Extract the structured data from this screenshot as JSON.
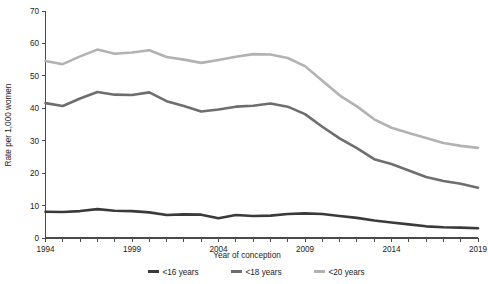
{
  "chart_data": {
    "type": "line",
    "title": "",
    "xlabel": "Year of conception",
    "ylabel": "Rate per 1,000 women",
    "xlim": [
      1994,
      2019
    ],
    "ylim": [
      0,
      70
    ],
    "ytick_step": 10,
    "xtick_step": 1,
    "xtick_label_step": 5,
    "grid": false,
    "legend_position": "bottom-center",
    "yticks": [
      0,
      10,
      20,
      30,
      40,
      50,
      60,
      70
    ],
    "xticks": [
      1994,
      1995,
      1996,
      1997,
      1998,
      1999,
      2000,
      2001,
      2002,
      2003,
      2004,
      2005,
      2006,
      2007,
      2008,
      2009,
      2010,
      2011,
      2012,
      2013,
      2014,
      2015,
      2016,
      2017,
      2018,
      2019
    ],
    "xtick_labels": [
      "1994",
      "",
      "",
      "",
      "",
      "1999",
      "",
      "",
      "",
      "",
      "2004",
      "",
      "",
      "",
      "",
      "2009",
      "",
      "",
      "",
      "",
      "2014",
      "",
      "",
      "",
      "",
      "2019"
    ],
    "x": [
      1994,
      1995,
      1996,
      1997,
      1998,
      1999,
      2000,
      2001,
      2002,
      2003,
      2004,
      2005,
      2006,
      2007,
      2008,
      2009,
      2010,
      2011,
      2012,
      2013,
      2014,
      2015,
      2016,
      2017,
      2018,
      2019
    ],
    "series": [
      {
        "name": "<16 years",
        "color": "#3a3a3a",
        "width": 2.6,
        "values": [
          8.1,
          8.0,
          8.3,
          8.9,
          8.4,
          8.3,
          7.9,
          7.1,
          7.3,
          7.2,
          6.1,
          7.1,
          6.8,
          6.9,
          7.4,
          7.6,
          7.4,
          6.8,
          6.2,
          5.4,
          4.8,
          4.2,
          3.6,
          3.3,
          3.2,
          3.0
        ]
      },
      {
        "name": "<18 years",
        "color": "#6e6e6e",
        "width": 2.6,
        "values": [
          41.6,
          40.7,
          43.0,
          45.0,
          44.2,
          44.1,
          44.9,
          42.2,
          40.7,
          39.0,
          39.6,
          40.5,
          40.8,
          41.5,
          40.5,
          38.2,
          34.3,
          30.7,
          27.7,
          24.3,
          22.8,
          20.8,
          18.8,
          17.6,
          16.7,
          15.5
        ]
      },
      {
        "name": "<20 years",
        "color": "#b2b2b2",
        "width": 2.6,
        "values": [
          54.6,
          53.6,
          56.0,
          58.1,
          56.8,
          57.2,
          57.9,
          55.8,
          55.0,
          54.0,
          54.9,
          55.9,
          56.7,
          56.6,
          55.5,
          53.0,
          48.5,
          44.0,
          40.6,
          36.6,
          34.0,
          32.4,
          30.8,
          29.3,
          28.4,
          27.8
        ]
      }
    ]
  },
  "legend": {
    "items": [
      {
        "label": "<16 years",
        "color": "#3a3a3a"
      },
      {
        "label": "<18 years",
        "color": "#6e6e6e"
      },
      {
        "label": "<20 years",
        "color": "#b2b2b2"
      }
    ]
  },
  "axes": {
    "y_title": "Rate per 1,000 women",
    "x_title": "Year of conception"
  }
}
